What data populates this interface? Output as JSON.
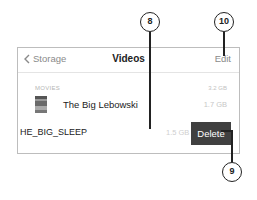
{
  "navbar": {
    "back_label": "Storage",
    "title": "Videos",
    "edit_label": "Edit"
  },
  "section": {
    "label": "MOVIES",
    "size": "3.2 GB"
  },
  "items": [
    {
      "title": "The Big Lebowski",
      "size": "1.7 GB"
    },
    {
      "title": "HE_BIG_SLEEP",
      "size": "1.5 GB",
      "delete_label": "Delete"
    }
  ],
  "callouts": [
    "8",
    "9",
    "10"
  ],
  "colors": {
    "delete_bg": "#404040",
    "text_muted": "#8a8a8a"
  }
}
